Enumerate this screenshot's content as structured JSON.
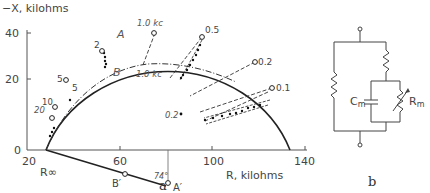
{
  "panel_a": {
    "caption": "a",
    "y_axis_label": "−X, kilohms",
    "x_axis_label": "R, kilohms",
    "y_ticks": [
      "40",
      "20",
      "0"
    ],
    "x_ticks": [
      "20",
      "60",
      "100",
      "140"
    ],
    "curve_A_label": "A",
    "curve_B_label": "B",
    "A_freq_labels": [
      "1.0 kc",
      "0.5",
      "0.2",
      "0.1",
      "2",
      "5",
      "10",
      "20"
    ],
    "B_freq_labels": [
      "1.0 kc",
      "0.2",
      "5"
    ],
    "r_inf_label": "R∞",
    "b_prime_label": "B′",
    "a_prime_label": "A′",
    "angle_label": "74°"
  },
  "panel_b": {
    "caption": "b",
    "cm_label": "C",
    "cm_sub": "m",
    "rm_label": "R",
    "rm_sub": "m"
  }
}
